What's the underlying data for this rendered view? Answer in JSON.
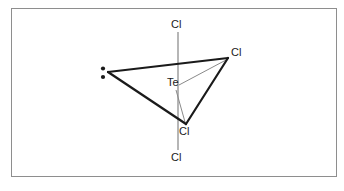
{
  "diagram": {
    "central_atom": "Te",
    "labels": {
      "cl_top": "Cl",
      "cl_right": "Cl",
      "te_center": "Te",
      "cl_bottom": "Cl",
      "cl_low": "Cl"
    },
    "lone_pair": {
      "name": "lone-pair-dots",
      "dot_count": 2
    },
    "colors": {
      "frame_border": "#8e8e8e",
      "bond_bold": "#1a1a1a",
      "bond_thin": "#7a7a7a",
      "text": "#1a1a1a",
      "background": "#ffffff"
    },
    "geometry": {
      "te": [
        178,
        86
      ],
      "cl_top_vertex": [
        178,
        32
      ],
      "cl_right_vertex": [
        228,
        58
      ],
      "cl_bottom_vertex": [
        186,
        124
      ],
      "cl_low_vertex": [
        178,
        150
      ],
      "lone_pair_vertex": [
        108,
        72
      ],
      "dot_upper": [
        103,
        69
      ],
      "dot_lower": [
        103,
        77
      ]
    }
  }
}
